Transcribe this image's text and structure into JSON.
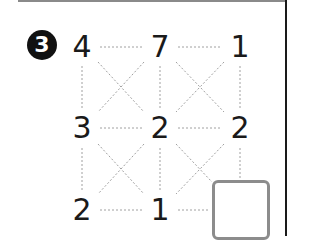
{
  "problem": {
    "number": "3",
    "grid": {
      "rows": [
        [
          "4",
          "7",
          "1"
        ],
        [
          "3",
          "2",
          "2"
        ],
        [
          "2",
          "1",
          ""
        ]
      ]
    },
    "answer_box": {
      "value": ""
    },
    "colors": {
      "text": "#1a1a1a",
      "dotted_lines": "#a0a0a0",
      "box_border": "#8c8c8c",
      "badge_bg": "#111111"
    }
  }
}
